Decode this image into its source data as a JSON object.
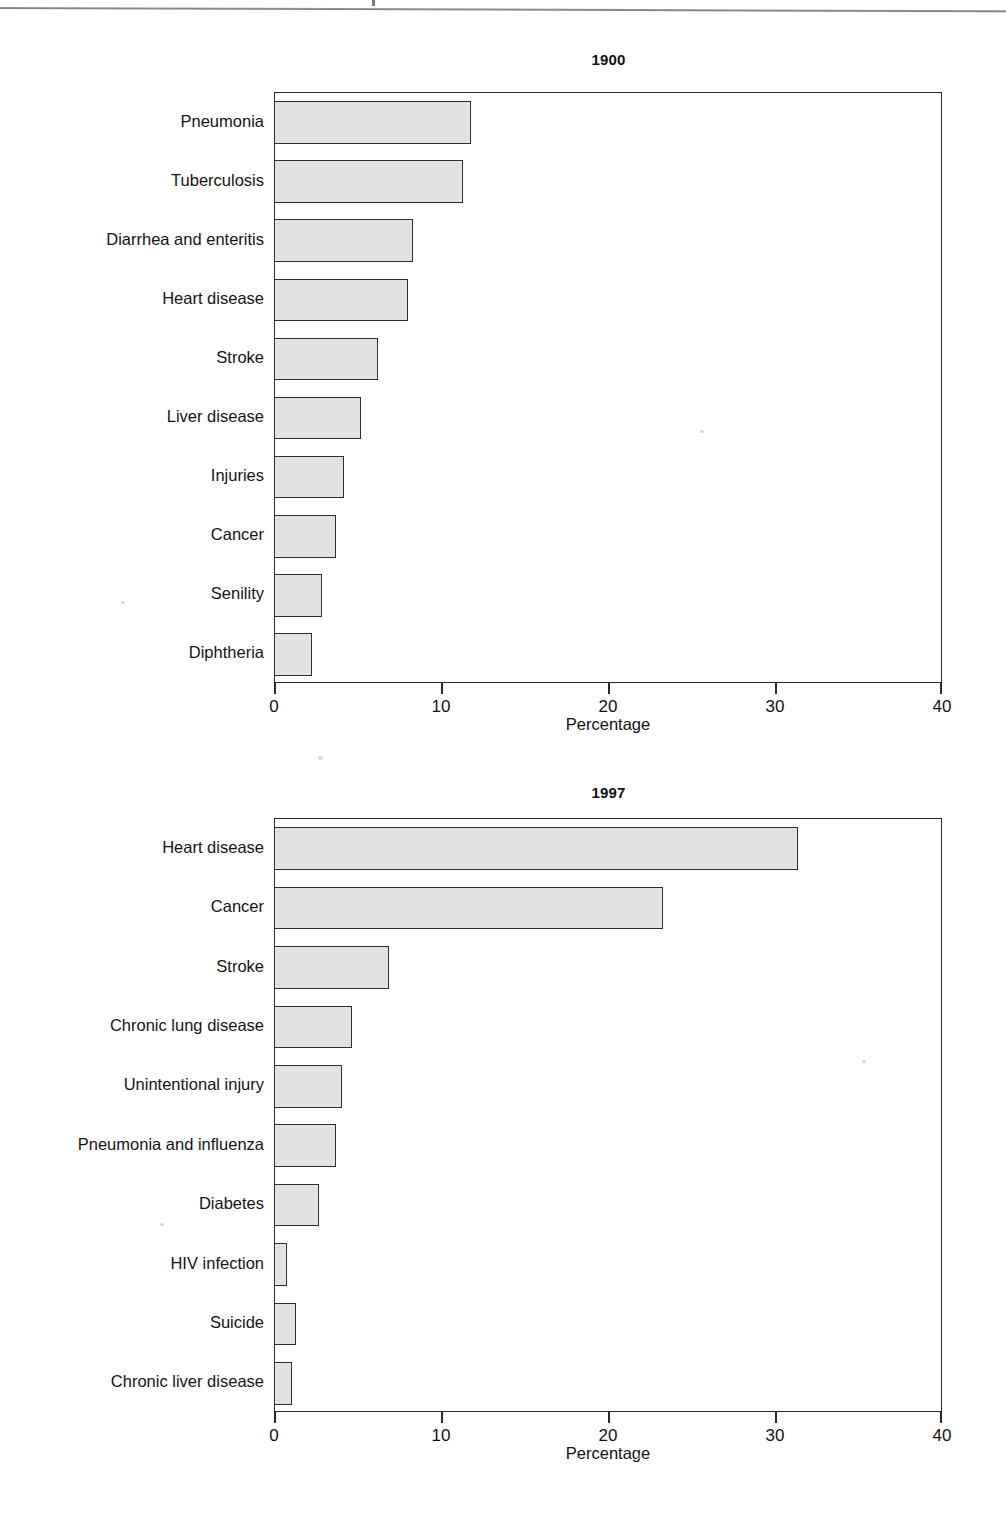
{
  "page": {
    "rule_present": true,
    "background": "#ffffff",
    "ink": "#1a1a1a"
  },
  "chart_data": [
    {
      "type": "bar",
      "orientation": "horizontal",
      "title": "1900",
      "xlabel": "Percentage",
      "ylabel": "",
      "xlim": [
        0,
        40
      ],
      "xticks": [
        0,
        10,
        20,
        30,
        40
      ],
      "xticklabels": [
        "0",
        "10",
        "20",
        "30",
        "40"
      ],
      "grid": false,
      "legend": false,
      "bar_fill": "#e2e2e2",
      "bar_edge": "#2e2e2e",
      "categories": [
        "Pneumonia",
        "Tuberculosis",
        "Diarrhea and enteritis",
        "Heart disease",
        "Stroke",
        "Liver disease",
        "Injuries",
        "Cancer",
        "Senility",
        "Diphtheria"
      ],
      "values": [
        11.8,
        11.3,
        8.3,
        8.0,
        6.2,
        5.2,
        4.2,
        3.7,
        2.9,
        2.3
      ]
    },
    {
      "type": "bar",
      "orientation": "horizontal",
      "title": "1997",
      "xlabel": "Percentage",
      "ylabel": "",
      "xlim": [
        0,
        40
      ],
      "xticks": [
        0,
        10,
        20,
        30,
        40
      ],
      "xticklabels": [
        "0",
        "10",
        "20",
        "30",
        "40"
      ],
      "grid": false,
      "legend": false,
      "bar_fill": "#e2e2e2",
      "bar_edge": "#2e2e2e",
      "categories": [
        "Heart disease",
        "Cancer",
        "Stroke",
        "Chronic lung disease",
        "Unintentional injury",
        "Pneumonia and influenza",
        "Diabetes",
        "HIV infection",
        "Suicide",
        "Chronic liver disease"
      ],
      "values": [
        31.4,
        23.3,
        6.9,
        4.7,
        4.1,
        3.7,
        2.7,
        0.8,
        1.3,
        1.1
      ]
    }
  ]
}
